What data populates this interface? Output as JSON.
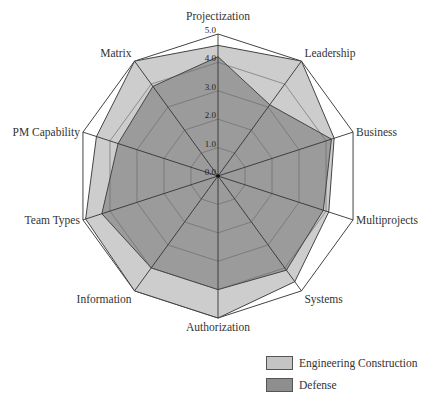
{
  "chart_data": {
    "type": "radar",
    "title": "",
    "categories": [
      "Projectization",
      "Leadership",
      "Business",
      "Multiprojects",
      "Systems",
      "Authorization",
      "Information",
      "Team Types",
      "PM Capability",
      "Matrix"
    ],
    "series": [
      {
        "name": "Engineering Construction",
        "color": "#c4c4c4",
        "values": [
          4.6,
          5.0,
          4.3,
          4.1,
          4.6,
          5.0,
          5.0,
          4.9,
          4.5,
          5.0
        ]
      },
      {
        "name": "Defense",
        "color": "#8e8e8e",
        "values": [
          4.2,
          3.1,
          4.2,
          3.9,
          4.1,
          4.0,
          4.0,
          4.3,
          3.7,
          3.9
        ]
      }
    ],
    "rlim": [
      0,
      5
    ],
    "tick_labels": [
      "0.0",
      "1.0",
      "2.0",
      "3.0",
      "4.0",
      "5.0"
    ],
    "grid": true,
    "legend_position": "bottom-right"
  },
  "legend": {
    "items": [
      {
        "label": "Engineering Construction"
      },
      {
        "label": "Defense"
      }
    ]
  }
}
